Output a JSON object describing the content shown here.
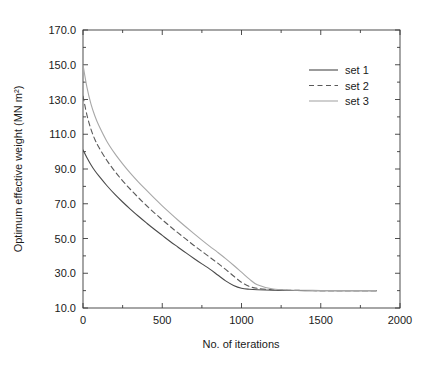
{
  "chart_data": {
    "type": "line",
    "title": "",
    "xlabel": "No. of iterations",
    "ylabel": "Optimum effective weight (MN m²)",
    "xlim": [
      0,
      2000
    ],
    "ylim": [
      10.0,
      170.0
    ],
    "xticks": [
      0,
      500,
      1000,
      1500,
      2000
    ],
    "xtick_labels": [
      "0",
      "500",
      "1000",
      "1500",
      "2000"
    ],
    "yticks": [
      10.0,
      30.0,
      50.0,
      70.0,
      90.0,
      110.0,
      130.0,
      150.0,
      170.0
    ],
    "ytick_labels": [
      "10.0",
      "30.0",
      "50.0",
      "70.0",
      "90.0",
      "110.0",
      "130.0",
      "150.0",
      "170.0"
    ],
    "grid": false,
    "legend_position": "upper-right",
    "series": [
      {
        "name": "set 1",
        "style": "solid",
        "color": "#4a4a4a",
        "width": 1.1,
        "x": [
          0,
          25,
          50,
          75,
          100,
          150,
          200,
          250,
          300,
          350,
          400,
          450,
          500,
          550,
          600,
          650,
          700,
          750,
          800,
          850,
          900,
          950,
          1000,
          1050,
          1100,
          1200,
          1300,
          1400,
          1500,
          1600,
          1700,
          1850
        ],
        "values": [
          101.0,
          96.5,
          92.5,
          89.0,
          86.0,
          80.5,
          75.5,
          71.0,
          66.8,
          62.8,
          59.0,
          55.3,
          51.8,
          48.3,
          45.0,
          41.7,
          38.5,
          35.4,
          32.4,
          29.0,
          25.6,
          23.0,
          21.4,
          20.8,
          20.5,
          20.2,
          20.1,
          20.0,
          20.0,
          20.0,
          20.0,
          20.0
        ]
      },
      {
        "name": "set 2",
        "style": "dashed",
        "color": "#5a5a5a",
        "width": 1.1,
        "x": [
          0,
          25,
          50,
          75,
          100,
          150,
          200,
          250,
          300,
          350,
          400,
          450,
          500,
          550,
          600,
          650,
          700,
          750,
          800,
          850,
          900,
          950,
          1000,
          1050,
          1100,
          1200,
          1300,
          1400,
          1500,
          1600,
          1700,
          1850
        ],
        "values": [
          132.0,
          121.0,
          113.0,
          107.0,
          102.5,
          95.0,
          88.8,
          83.2,
          78.2,
          73.5,
          69.0,
          64.8,
          60.8,
          56.9,
          53.2,
          49.6,
          46.0,
          42.6,
          39.2,
          35.8,
          32.2,
          28.4,
          24.8,
          22.4,
          21.3,
          20.5,
          20.2,
          20.1,
          20.0,
          20.0,
          20.0,
          20.0
        ]
      },
      {
        "name": "set 3",
        "style": "solid",
        "color": "#a8a8a8",
        "width": 1.1,
        "x": [
          0,
          25,
          50,
          75,
          100,
          150,
          200,
          250,
          300,
          350,
          400,
          450,
          500,
          550,
          600,
          650,
          700,
          750,
          800,
          850,
          900,
          950,
          1000,
          1050,
          1100,
          1200,
          1300,
          1400,
          1500,
          1600,
          1700,
          1850
        ],
        "values": [
          150.0,
          137.0,
          127.5,
          120.5,
          115.0,
          106.0,
          99.0,
          93.0,
          87.5,
          82.5,
          77.8,
          73.2,
          68.8,
          64.6,
          60.5,
          56.6,
          52.8,
          49.1,
          45.5,
          42.0,
          38.4,
          34.6,
          30.6,
          26.6,
          23.4,
          20.9,
          20.4,
          20.2,
          20.1,
          20.0,
          20.0,
          20.0
        ]
      }
    ],
    "legend_entries": [
      {
        "label": "set 1",
        "style": "solid",
        "color": "#4a4a4a"
      },
      {
        "label": "set 2",
        "style": "dashed",
        "color": "#5a5a5a"
      },
      {
        "label": "set 3",
        "style": "solid",
        "color": "#a8a8a8"
      }
    ]
  }
}
